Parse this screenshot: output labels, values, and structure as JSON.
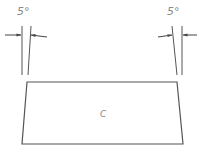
{
  "diagram": {
    "type": "technical-sketch",
    "left_marker": {
      "angle_label": "5°"
    },
    "right_marker": {
      "angle_label": "5°"
    },
    "shape": {
      "kind": "trapezoid",
      "label": "C"
    },
    "colors": {
      "line": "#555555",
      "text": "#8a8a8a",
      "background": "#ffffff"
    }
  }
}
